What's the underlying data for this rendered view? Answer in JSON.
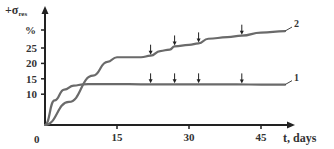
{
  "chart_data": {
    "type": "line",
    "title": "",
    "xlabel": "t, days",
    "ylabel": "+σ_res, %",
    "xlim": [
      0,
      50
    ],
    "ylim": [
      0,
      32
    ],
    "x_ticks": [
      15,
      30,
      45
    ],
    "y_ticks": [
      10,
      15,
      20,
      25
    ],
    "y_unit_label": "%",
    "origin_label": "0",
    "grid": false,
    "legend_position": "inline-right",
    "series": [
      {
        "name": "1",
        "x": [
          0,
          2,
          4,
          6,
          8,
          10,
          15,
          20,
          25,
          30,
          35,
          40,
          45,
          50
        ],
        "values": [
          0,
          8,
          11.5,
          12.8,
          13.2,
          13.3,
          13.3,
          13.2,
          13.2,
          13.2,
          13.2,
          13.2,
          13.1,
          13.1
        ],
        "markers_at": [
          22,
          27,
          32,
          41
        ]
      },
      {
        "name": "2",
        "x": [
          0,
          5,
          10,
          13,
          15,
          20,
          22,
          24,
          26,
          27,
          30,
          32,
          34,
          38,
          41,
          45,
          50
        ],
        "values": [
          0,
          7.5,
          16,
          20.5,
          22,
          22,
          22.5,
          24,
          24.5,
          25.5,
          26,
          26.5,
          28,
          28.5,
          29,
          30,
          30.5
        ],
        "markers_at": [
          22,
          27,
          32,
          41
        ]
      }
    ]
  }
}
